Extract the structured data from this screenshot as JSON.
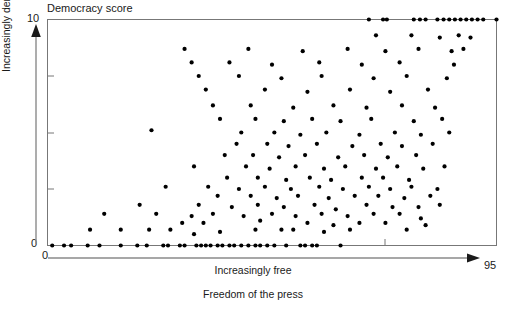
{
  "chart_data": {
    "type": "scatter",
    "title": "Democracy score",
    "xlabel": "Freedom of the press",
    "xarrow_label": "Increasingly free",
    "ylabel": "Increasingly democratic",
    "xlim": [
      0,
      95
    ],
    "ylim": [
      0,
      10
    ],
    "x_tick_labels": [
      "0",
      "95"
    ],
    "y_tick_labels": [
      "0",
      "10"
    ],
    "grid": false,
    "legend": null,
    "marker": "filled-circle",
    "marker_color": "#000000",
    "n_points": 176,
    "points": [
      [
        1.0,
        0.0
      ],
      [
        3.5,
        0.0
      ],
      [
        5.0,
        0.0
      ],
      [
        8.5,
        0.0
      ],
      [
        11.0,
        0.0
      ],
      [
        15.5,
        0.0
      ],
      [
        19.0,
        0.0
      ],
      [
        21.0,
        0.0
      ],
      [
        24.5,
        0.0
      ],
      [
        25.5,
        0.0
      ],
      [
        28.0,
        0.0
      ],
      [
        29.0,
        0.0
      ],
      [
        31.5,
        0.0
      ],
      [
        32.5,
        0.0
      ],
      [
        33.5,
        0.0
      ],
      [
        34.5,
        0.0
      ],
      [
        36.0,
        0.0
      ],
      [
        37.0,
        0.0
      ],
      [
        38.5,
        0.0
      ],
      [
        39.5,
        0.0
      ],
      [
        41.0,
        0.0
      ],
      [
        42.5,
        0.0
      ],
      [
        44.0,
        0.0
      ],
      [
        45.0,
        0.0
      ],
      [
        46.5,
        0.0
      ],
      [
        48.0,
        0.0
      ],
      [
        50.5,
        0.0
      ],
      [
        53.5,
        0.0
      ],
      [
        54.5,
        0.0
      ],
      [
        56.0,
        0.0
      ],
      [
        57.0,
        0.0
      ],
      [
        62.0,
        0.0
      ],
      [
        9.0,
        0.7
      ],
      [
        15.5,
        0.7
      ],
      [
        21.5,
        0.7
      ],
      [
        26.0,
        0.7
      ],
      [
        31.0,
        0.5
      ],
      [
        36.5,
        0.6
      ],
      [
        44.0,
        0.7
      ],
      [
        49.5,
        0.7
      ],
      [
        52.0,
        0.7
      ],
      [
        58.5,
        0.6
      ],
      [
        64.0,
        0.7
      ],
      [
        28.5,
        1.0
      ],
      [
        33.0,
        1.0
      ],
      [
        45.0,
        1.1
      ],
      [
        55.0,
        1.0
      ],
      [
        60.5,
        0.9
      ],
      [
        66.0,
        1.0
      ],
      [
        71.5,
        1.0
      ],
      [
        76.0,
        0.7
      ],
      [
        80.0,
        0.9
      ],
      [
        12.0,
        1.4
      ],
      [
        23.0,
        1.4
      ],
      [
        30.5,
        1.3
      ],
      [
        35.0,
        1.4
      ],
      [
        41.5,
        1.3
      ],
      [
        47.5,
        1.4
      ],
      [
        52.5,
        1.3
      ],
      [
        58.0,
        1.4
      ],
      [
        63.5,
        1.3
      ],
      [
        69.0,
        1.4
      ],
      [
        74.5,
        1.4
      ],
      [
        79.0,
        1.2
      ],
      [
        19.5,
        1.8
      ],
      [
        32.0,
        1.8
      ],
      [
        39.0,
        1.7
      ],
      [
        44.5,
        1.8
      ],
      [
        50.0,
        1.7
      ],
      [
        56.5,
        1.8
      ],
      [
        61.0,
        1.6
      ],
      [
        67.5,
        1.8
      ],
      [
        73.0,
        1.7
      ],
      [
        78.5,
        1.7
      ],
      [
        83.0,
        1.8
      ],
      [
        36.0,
        2.2
      ],
      [
        43.0,
        2.2
      ],
      [
        48.5,
        2.1
      ],
      [
        53.0,
        2.2
      ],
      [
        59.5,
        2.1
      ],
      [
        65.0,
        2.2
      ],
      [
        70.0,
        2.2
      ],
      [
        75.5,
        2.1
      ],
      [
        81.0,
        2.2
      ],
      [
        25.0,
        2.6
      ],
      [
        34.0,
        2.6
      ],
      [
        40.5,
        2.5
      ],
      [
        46.0,
        2.6
      ],
      [
        51.5,
        2.5
      ],
      [
        57.5,
        2.6
      ],
      [
        62.5,
        2.5
      ],
      [
        68.0,
        2.6
      ],
      [
        72.5,
        2.5
      ],
      [
        77.0,
        2.6
      ],
      [
        82.5,
        2.5
      ],
      [
        38.0,
        3.0
      ],
      [
        44.5,
        3.0
      ],
      [
        50.5,
        2.9
      ],
      [
        55.5,
        3.0
      ],
      [
        60.0,
        2.9
      ],
      [
        66.5,
        3.0
      ],
      [
        71.0,
        3.0
      ],
      [
        76.5,
        2.9
      ],
      [
        31.0,
        3.5
      ],
      [
        42.0,
        3.5
      ],
      [
        47.0,
        3.4
      ],
      [
        52.5,
        3.5
      ],
      [
        58.5,
        3.4
      ],
      [
        63.0,
        3.5
      ],
      [
        69.5,
        3.4
      ],
      [
        74.0,
        3.5
      ],
      [
        79.5,
        3.4
      ],
      [
        84.0,
        3.5
      ],
      [
        37.5,
        4.0
      ],
      [
        43.5,
        4.0
      ],
      [
        49.0,
        3.9
      ],
      [
        54.5,
        4.0
      ],
      [
        61.5,
        3.9
      ],
      [
        67.0,
        4.0
      ],
      [
        72.0,
        3.9
      ],
      [
        78.0,
        4.0
      ],
      [
        40.0,
        4.5
      ],
      [
        46.5,
        4.5
      ],
      [
        51.0,
        4.4
      ],
      [
        57.0,
        4.5
      ],
      [
        64.5,
        4.4
      ],
      [
        70.5,
        4.5
      ],
      [
        75.0,
        4.4
      ],
      [
        81.5,
        4.5
      ],
      [
        22.0,
        5.1
      ],
      [
        41.0,
        5.0
      ],
      [
        48.0,
        5.0
      ],
      [
        53.5,
        4.9
      ],
      [
        59.0,
        5.0
      ],
      [
        66.0,
        4.9
      ],
      [
        73.5,
        5.0
      ],
      [
        79.0,
        4.9
      ],
      [
        85.0,
        5.0
      ],
      [
        36.5,
        5.6
      ],
      [
        44.0,
        5.6
      ],
      [
        50.0,
        5.5
      ],
      [
        56.0,
        5.6
      ],
      [
        62.0,
        5.5
      ],
      [
        68.5,
        5.6
      ],
      [
        77.5,
        5.5
      ],
      [
        83.5,
        5.6
      ],
      [
        35.0,
        6.2
      ],
      [
        43.0,
        6.2
      ],
      [
        52.0,
        6.1
      ],
      [
        60.5,
        6.2
      ],
      [
        67.5,
        6.1
      ],
      [
        75.0,
        6.2
      ],
      [
        82.0,
        6.1
      ],
      [
        33.5,
        6.9
      ],
      [
        46.0,
        6.9
      ],
      [
        55.0,
        6.8
      ],
      [
        64.0,
        6.9
      ],
      [
        72.5,
        6.8
      ],
      [
        80.5,
        6.9
      ],
      [
        32.0,
        7.5
      ],
      [
        40.5,
        7.5
      ],
      [
        49.5,
        7.4
      ],
      [
        58.0,
        7.5
      ],
      [
        69.0,
        7.4
      ],
      [
        76.0,
        7.5
      ],
      [
        84.5,
        7.4
      ],
      [
        30.5,
        8.1
      ],
      [
        38.5,
        8.1
      ],
      [
        47.5,
        8.0
      ],
      [
        57.5,
        8.1
      ],
      [
        66.5,
        8.0
      ],
      [
        74.5,
        8.1
      ],
      [
        86.0,
        8.0
      ],
      [
        29.0,
        8.7
      ],
      [
        42.5,
        8.7
      ],
      [
        54.0,
        8.6
      ],
      [
        63.5,
        8.7
      ],
      [
        71.5,
        8.6
      ],
      [
        78.5,
        8.7
      ],
      [
        85.5,
        8.6
      ],
      [
        88.0,
        8.7
      ],
      [
        69.5,
        9.3
      ],
      [
        77.0,
        9.3
      ],
      [
        83.0,
        9.2
      ],
      [
        87.0,
        9.3
      ],
      [
        89.5,
        9.2
      ],
      [
        68.0,
        10.0
      ],
      [
        71.0,
        10.0
      ],
      [
        71.8,
        10.0
      ],
      [
        77.5,
        10.0
      ],
      [
        78.8,
        10.0
      ],
      [
        80.0,
        10.0
      ],
      [
        82.5,
        10.0
      ],
      [
        83.8,
        10.0
      ],
      [
        85.0,
        10.0
      ],
      [
        86.2,
        10.0
      ],
      [
        87.4,
        10.0
      ],
      [
        88.6,
        10.0
      ],
      [
        89.8,
        10.0
      ],
      [
        91.0,
        10.0
      ],
      [
        92.2,
        10.0
      ],
      [
        95.0,
        10.0
      ]
    ]
  }
}
